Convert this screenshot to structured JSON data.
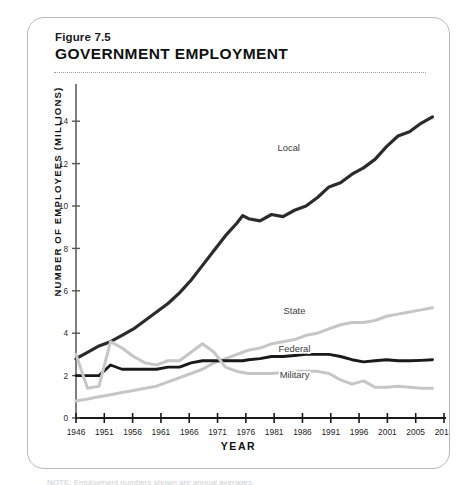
{
  "figure": {
    "number": "Figure 7.5",
    "title": "GOVERNMENT EMPLOYMENT",
    "footnote": "NOTE: Employment numbers shown are annual averages."
  },
  "chart_data": {
    "type": "line",
    "title": "GOVERNMENT EMPLOYMENT",
    "xlabel": "YEAR",
    "ylabel": "NUMBER OF EMPLOYEES (MILLIONS)",
    "xlim": [
      1946,
      2010
    ],
    "ylim": [
      0,
      15
    ],
    "grid": false,
    "legend_position": "inline-labels",
    "xticks": [
      "1946",
      "1951",
      "1956",
      "1961",
      "1966",
      "1971",
      "1976",
      "1981",
      "1986",
      "1991",
      "1996",
      "2001",
      "2005",
      "2010"
    ],
    "yticks": [
      "0",
      "2",
      "4",
      "6",
      "8",
      "10",
      "12",
      "14"
    ],
    "x": [
      1946,
      1948,
      1950,
      1952,
      1954,
      1956,
      1958,
      1960,
      1962,
      1964,
      1966,
      1968,
      1970,
      1972,
      1974,
      1975,
      1976,
      1978,
      1980,
      1982,
      1984,
      1986,
      1988,
      1990,
      1992,
      1994,
      1996,
      1998,
      2000,
      2002,
      2004,
      2006,
      2008
    ],
    "series": [
      {
        "name": "Local",
        "color": "#2b2b2b",
        "label_x": 1983,
        "label_y": 12.6,
        "values": [
          2.8,
          3.1,
          3.4,
          3.6,
          3.9,
          4.2,
          4.6,
          5.0,
          5.4,
          5.9,
          6.5,
          7.2,
          7.9,
          8.6,
          9.2,
          9.55,
          9.4,
          9.3,
          9.6,
          9.5,
          9.8,
          10.0,
          10.4,
          10.9,
          11.1,
          11.5,
          11.8,
          12.2,
          12.8,
          13.3,
          13.5,
          13.9,
          14.2
        ]
      },
      {
        "name": "State",
        "color": "#c6c6c6",
        "label_x": 1984,
        "label_y": 4.9,
        "values": [
          0.8,
          0.9,
          1.0,
          1.1,
          1.2,
          1.3,
          1.4,
          1.5,
          1.7,
          1.9,
          2.1,
          2.3,
          2.6,
          2.8,
          3.0,
          3.1,
          3.2,
          3.3,
          3.5,
          3.6,
          3.7,
          3.9,
          4.0,
          4.2,
          4.4,
          4.5,
          4.5,
          4.6,
          4.8,
          4.9,
          5.0,
          5.1,
          5.2
        ]
      },
      {
        "name": "Federal",
        "color": "#1a1a1a",
        "label_x": 1984,
        "label_y": 3.1,
        "values": [
          2.0,
          2.0,
          2.0,
          2.5,
          2.3,
          2.3,
          2.3,
          2.3,
          2.4,
          2.4,
          2.6,
          2.7,
          2.7,
          2.7,
          2.7,
          2.7,
          2.75,
          2.8,
          2.9,
          2.9,
          2.95,
          3.0,
          3.0,
          3.0,
          2.9,
          2.75,
          2.65,
          2.7,
          2.75,
          2.7,
          2.7,
          2.72,
          2.75
        ]
      },
      {
        "name": "Military",
        "color": "#c6c6c6",
        "label_x": 1984,
        "label_y": 1.9,
        "values": [
          3.0,
          1.4,
          1.5,
          3.6,
          3.3,
          2.9,
          2.6,
          2.5,
          2.7,
          2.7,
          3.1,
          3.5,
          3.1,
          2.4,
          2.2,
          2.15,
          2.1,
          2.1,
          2.1,
          2.15,
          2.2,
          2.2,
          2.2,
          2.1,
          1.8,
          1.6,
          1.75,
          1.45,
          1.45,
          1.5,
          1.45,
          1.4,
          1.4
        ]
      }
    ]
  }
}
